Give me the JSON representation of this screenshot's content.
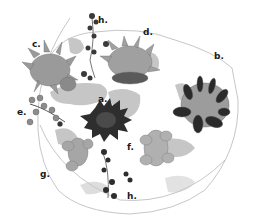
{
  "figure": {
    "labels": {
      "a": "a.",
      "b": "b.",
      "c": "c.",
      "d": "d.",
      "e": "e.",
      "f": "f.",
      "g": "g.",
      "h_top": "h.",
      "h_bottom": "h."
    },
    "colors": {
      "outline": "#b8b8b8",
      "pebbles": "#c4c4c4",
      "dark_plant": "#2e2e2e",
      "mid_plant": "#8a8a8a",
      "light_plant": "#a8a8a8"
    }
  }
}
